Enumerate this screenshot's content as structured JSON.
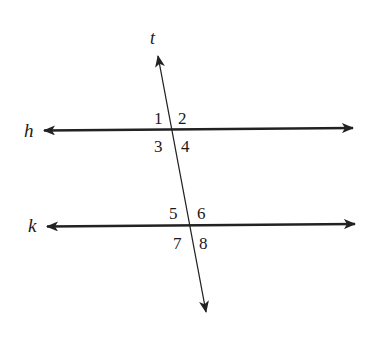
{
  "diagram": {
    "lines": {
      "transversal": {
        "label": "t"
      },
      "upper": {
        "label": "h"
      },
      "lower": {
        "label": "k"
      }
    },
    "angles": {
      "a1": "1",
      "a2": "2",
      "a3": "3",
      "a4": "4",
      "a5": "5",
      "a6": "6",
      "a7": "7",
      "a8": "8"
    },
    "colors": {
      "stroke": "#222222",
      "background": "#ffffff"
    }
  }
}
